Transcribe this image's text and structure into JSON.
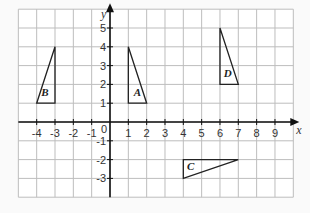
{
  "grid": {
    "x_min": -5,
    "x_max": 10,
    "y_min": -4,
    "y_max": 6,
    "origin_px": [
      110,
      122
    ],
    "cell_px": [
      18.33,
      18.8
    ],
    "grid_color": "#bdbdbd",
    "axis_color": "#111111"
  },
  "axes": {
    "x_label": "x",
    "y_label": "y",
    "origin_label": "0",
    "x_ticks": [
      "-4",
      "-3",
      "-2",
      "-1",
      "1",
      "2",
      "3",
      "4",
      "5",
      "6",
      "7",
      "8",
      "9"
    ],
    "y_ticks": [
      "-3",
      "-2",
      "-1",
      "1",
      "2",
      "3",
      "4",
      "5"
    ]
  },
  "shapes": [
    {
      "name": "A",
      "vertices": [
        [
          1,
          1
        ],
        [
          2,
          1
        ],
        [
          1,
          4
        ]
      ],
      "label_pos": [
        1.3,
        1.4
      ]
    },
    {
      "name": "B",
      "vertices": [
        [
          -4,
          1
        ],
        [
          -3,
          1
        ],
        [
          -3,
          4
        ]
      ],
      "label_pos": [
        -3.75,
        1.4
      ]
    },
    {
      "name": "C",
      "vertices": [
        [
          4,
          -2
        ],
        [
          7,
          -2
        ],
        [
          4,
          -3
        ]
      ],
      "label_pos": [
        4.2,
        -2.55
      ]
    },
    {
      "name": "D",
      "vertices": [
        [
          6,
          2
        ],
        [
          7,
          2
        ],
        [
          6,
          5
        ]
      ],
      "label_pos": [
        6.2,
        2.4
      ]
    }
  ]
}
